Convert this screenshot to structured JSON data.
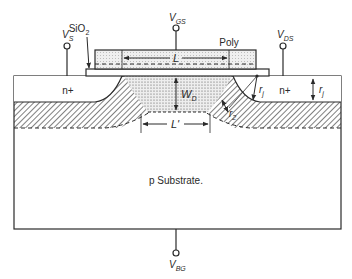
{
  "diagram": {
    "type": "MOSFET cross-section",
    "labels": {
      "vgs": {
        "main": "V",
        "sub": "GS"
      },
      "vs": {
        "main": "V",
        "sub": "S"
      },
      "vds": {
        "main": "V",
        "sub": "DS"
      },
      "vbg": {
        "main": "V",
        "sub": "BG"
      },
      "sio2": {
        "main": "SiO",
        "sub": "2"
      },
      "poly": "Poly",
      "gate_length": "L",
      "effective_length": "L'",
      "depletion_width": {
        "main": "W",
        "sub": "D"
      },
      "junction_depth_left": {
        "main": "r",
        "sub": "j"
      },
      "junction_depth_right": {
        "main": "r",
        "sub": "j"
      },
      "r2": {
        "main": "r",
        "sub": "2"
      },
      "source_region": "n+",
      "drain_region": "n+",
      "substrate": "p Substrate."
    },
    "colors": {
      "line": "#2a2a2a",
      "poly_fill": "#e6e6e6",
      "depletion_fill": "#d8d8d8",
      "background": "#ffffff"
    }
  }
}
